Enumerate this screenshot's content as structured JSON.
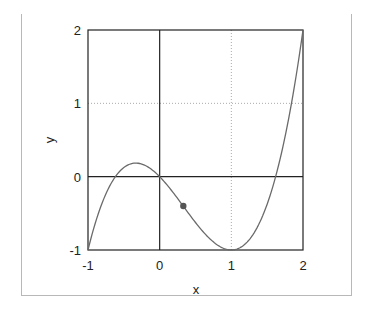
{
  "chart_data": {
    "type": "line",
    "title": "",
    "function": "y = x^3 - x^2 - x",
    "xlabel": "x",
    "ylabel": "y",
    "xlim": [
      -1,
      2
    ],
    "ylim": [
      -1,
      2
    ],
    "xticks": [
      "-1",
      "0",
      "1",
      "2"
    ],
    "yticks": [
      "-1",
      "0",
      "1",
      "2"
    ],
    "grid": {
      "x_dotted": [
        1
      ],
      "y_dotted": [
        1
      ],
      "x_solid": [
        0
      ],
      "y_solid": [
        0
      ]
    },
    "series": [
      {
        "name": "curve",
        "color": "#6a6a6a",
        "x": [
          -1,
          -0.75,
          -0.5,
          -0.333,
          -0.25,
          0,
          0.25,
          0.5,
          0.75,
          1,
          1.25,
          1.5,
          1.618,
          1.75,
          2
        ],
        "y": [
          -1,
          -0.234,
          0.125,
          0.185,
          0.172,
          0,
          -0.297,
          -0.625,
          -0.891,
          -1,
          -0.859,
          -0.375,
          0,
          0.547,
          2
        ]
      }
    ],
    "marker": {
      "x": 0.33,
      "y": -0.4,
      "color": "#555555"
    }
  }
}
